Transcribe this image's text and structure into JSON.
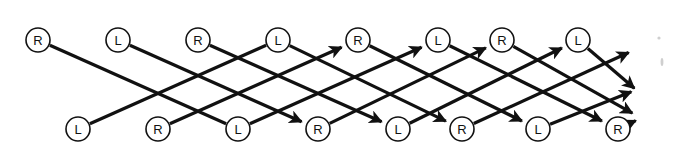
{
  "figure": {
    "name": "braid-lattice-diagram",
    "type": "network-lattice",
    "background_color": "#ffffff",
    "line_color": "#111111",
    "node_fill": "#ffffff",
    "node_stroke": "#111111",
    "node_radius": 12,
    "edge_width": 3.2,
    "canvas": {
      "width": 678,
      "height": 154
    }
  },
  "chart_data": {
    "type": "diagram",
    "title": "",
    "rows": [
      {
        "row_name": "top-row",
        "y": 40,
        "nodes": [
          {
            "label": "R",
            "x": 38
          },
          {
            "label": "L",
            "x": 118
          },
          {
            "label": "R",
            "x": 198
          },
          {
            "label": "L",
            "x": 278
          },
          {
            "label": "R",
            "x": 358
          },
          {
            "label": "L",
            "x": 438
          },
          {
            "label": "R",
            "x": 502
          },
          {
            "label": "L",
            "x": 578
          }
        ]
      },
      {
        "row_name": "bottom-row",
        "y": 129,
        "nodes": [
          {
            "label": "L",
            "x": 78
          },
          {
            "label": "R",
            "x": 158
          },
          {
            "label": "L",
            "x": 238
          },
          {
            "label": "R",
            "x": 318
          },
          {
            "label": "L",
            "x": 398
          },
          {
            "label": "R",
            "x": 462
          },
          {
            "label": "L",
            "x": 538
          },
          {
            "label": "R",
            "x": 618
          }
        ]
      }
    ],
    "edges_descending": [
      {
        "from": [
          38,
          40
        ],
        "to": [
          238,
          129
        ],
        "arrow": false
      },
      {
        "from": [
          118,
          40
        ],
        "to": [
          318,
          129
        ],
        "arrow": true
      },
      {
        "from": [
          198,
          40
        ],
        "to": [
          398,
          129
        ],
        "arrow": true
      },
      {
        "from": [
          278,
          40
        ],
        "to": [
          462,
          129
        ],
        "arrow": true
      },
      {
        "from": [
          358,
          40
        ],
        "to": [
          538,
          129
        ],
        "arrow": true
      },
      {
        "from": [
          438,
          40
        ],
        "to": [
          618,
          129
        ],
        "arrow": true
      },
      {
        "from": [
          502,
          40
        ],
        "to": [
          648,
          122
        ],
        "arrow": true
      },
      {
        "from": [
          578,
          40
        ],
        "to": [
          648,
          100
        ],
        "arrow": true
      }
    ],
    "edges_ascending": [
      {
        "from": [
          78,
          129
        ],
        "to": [
          278,
          40
        ],
        "arrow": false
      },
      {
        "from": [
          158,
          129
        ],
        "to": [
          358,
          40
        ],
        "arrow": true
      },
      {
        "from": [
          238,
          129
        ],
        "to": [
          438,
          40
        ],
        "arrow": true
      },
      {
        "from": [
          318,
          129
        ],
        "to": [
          502,
          40
        ],
        "arrow": true
      },
      {
        "from": [
          398,
          129
        ],
        "to": [
          578,
          40
        ],
        "arrow": true
      },
      {
        "from": [
          462,
          129
        ],
        "to": [
          645,
          45
        ],
        "arrow": true
      },
      {
        "from": [
          538,
          129
        ],
        "to": [
          648,
          85
        ],
        "arrow": true
      },
      {
        "from": [
          618,
          129
        ],
        "to": [
          652,
          113
        ],
        "arrow": true
      }
    ],
    "exit_arrows": [
      {
        "at": [
          645,
          45
        ],
        "direction": "up-right"
      },
      {
        "at": [
          648,
          85
        ],
        "direction": "up-right"
      },
      {
        "at": [
          648,
          100
        ],
        "direction": "down-right"
      },
      {
        "at": [
          652,
          113
        ],
        "direction": "up-right"
      }
    ],
    "legend": [],
    "annotations": []
  }
}
